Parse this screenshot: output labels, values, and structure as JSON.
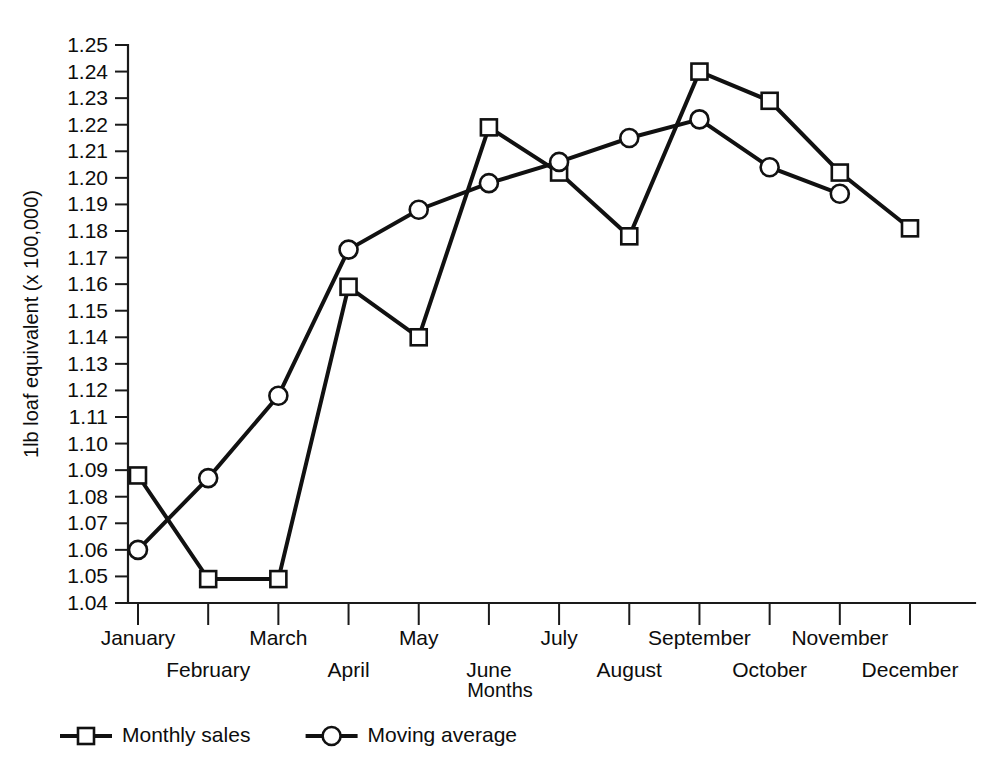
{
  "chart_data": {
    "type": "line",
    "title": "",
    "xlabel": "Months",
    "ylabel": "1lb loaf equivalent (x 100,000)",
    "categories": [
      "January",
      "February",
      "March",
      "April",
      "May",
      "June",
      "July",
      "August",
      "September",
      "October",
      "November",
      "December"
    ],
    "ylim": [
      1.04,
      1.25
    ],
    "ytick_step": 0.01,
    "ytick_labels": [
      "1.04",
      "1.05",
      "1.06",
      "1.07",
      "1.08",
      "1.09",
      "1.10",
      "1.11",
      "1.12",
      "1.13",
      "1.14",
      "1.15",
      "1.16",
      "1.17",
      "1.18",
      "1.19",
      "1.20",
      "1.21",
      "1.22",
      "1.23",
      "1.24",
      "1.25"
    ],
    "grid": false,
    "legend_position": "bottom-left",
    "series": [
      {
        "name": "Monthly sales",
        "marker": "square",
        "values": [
          1.088,
          1.049,
          1.049,
          1.159,
          1.14,
          1.219,
          1.202,
          1.178,
          1.24,
          1.229,
          1.202,
          1.181
        ]
      },
      {
        "name": "Moving average",
        "marker": "circle",
        "values": [
          1.06,
          1.087,
          1.118,
          1.173,
          1.188,
          1.198,
          1.206,
          1.215,
          1.222,
          1.204,
          1.194,
          null
        ]
      }
    ]
  },
  "legend": {
    "items": [
      {
        "label": "Monthly sales",
        "marker": "square"
      },
      {
        "label": "Moving average",
        "marker": "circle"
      }
    ]
  }
}
